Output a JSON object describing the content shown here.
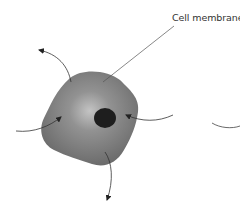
{
  "diagram": {
    "title": "",
    "labels": {
      "cell_membrane": "Cell membrane"
    },
    "components": [
      {
        "id": "cell-body",
        "shape": "rounded-blob",
        "fill": "#7a7a7a",
        "highlight": "#c8c8c8"
      },
      {
        "id": "nucleus",
        "shape": "ellipse",
        "fill": "#1e1e1e"
      },
      {
        "id": "arrow-out-top-left",
        "direction": "outward"
      },
      {
        "id": "arrow-in-left",
        "direction": "inward"
      },
      {
        "id": "arrow-in-right",
        "direction": "inward"
      },
      {
        "id": "arrow-out-bottom",
        "direction": "outward"
      },
      {
        "id": "partial-curve-right",
        "direction": "none"
      }
    ],
    "colors": {
      "cell_dark": "#6e6e6e",
      "cell_light": "#bdbdbd",
      "nucleus": "#1e1e1e",
      "line": "#333333",
      "leader_line": "#555555"
    }
  }
}
